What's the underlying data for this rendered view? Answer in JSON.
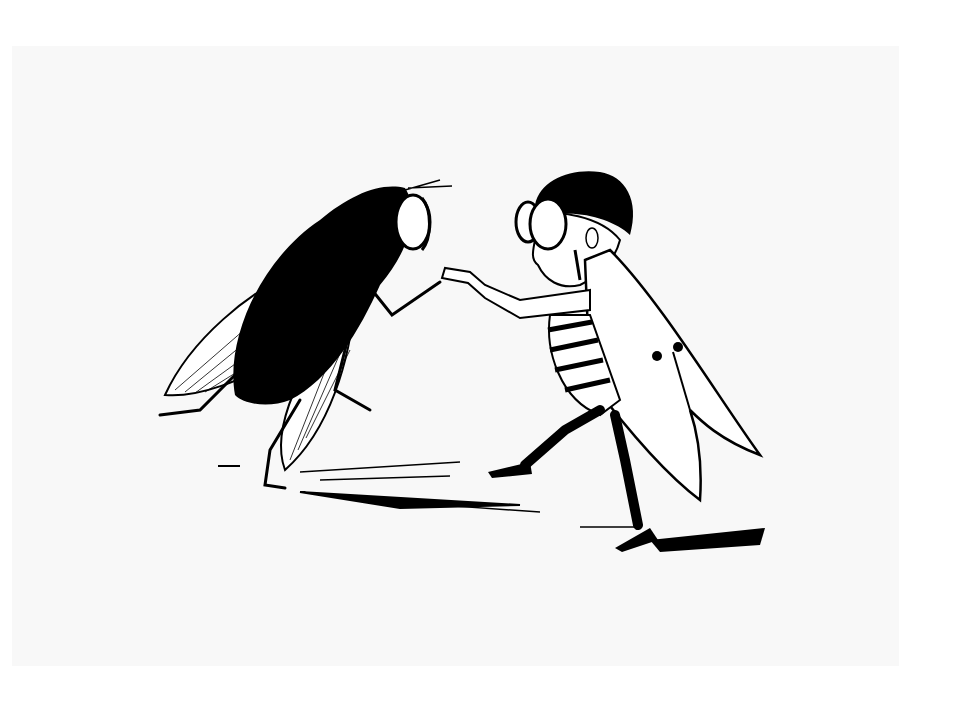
{
  "image": {
    "background": "#ffffff",
    "card_color": "#f8f8f8",
    "ink_color": "#000000",
    "subjects": [
      {
        "id": "dark-fly",
        "description": "large hairy black housefly with veined wings, standing upright, extending a leg"
      },
      {
        "id": "dressed-fly",
        "description": "fly-man with goggle eyes, spiky hair, striped body and white wing coat, shaking hands"
      }
    ]
  }
}
